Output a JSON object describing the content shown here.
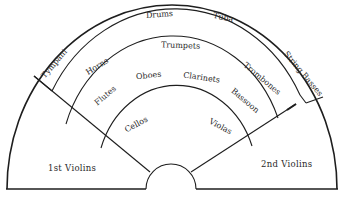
{
  "diagram": {
    "sections": [
      {
        "id": "drums",
        "label": "Drums"
      },
      {
        "id": "tuba",
        "label": "Tuba"
      },
      {
        "id": "tympani",
        "label": "Tympani"
      },
      {
        "id": "string_basses",
        "label": "String Basses"
      },
      {
        "id": "horns",
        "label": "Horns"
      },
      {
        "id": "trumpets",
        "label": "Trumpets"
      },
      {
        "id": "trombones",
        "label": "Trombones"
      },
      {
        "id": "flutes",
        "label": "Flutes"
      },
      {
        "id": "oboes",
        "label": "Oboes"
      },
      {
        "id": "clarinets",
        "label": "Clarinets"
      },
      {
        "id": "bassoon",
        "label": "Bassoon"
      },
      {
        "id": "cellos",
        "label": "Cellos"
      },
      {
        "id": "violas",
        "label": "Violas"
      },
      {
        "id": "first_violins",
        "label": "1st Violins"
      },
      {
        "id": "second_violins",
        "label": "2nd Violins"
      }
    ],
    "colors": {
      "line": "#1e1e1e",
      "text": "#2a2a2a",
      "background": "#ffffff"
    }
  }
}
